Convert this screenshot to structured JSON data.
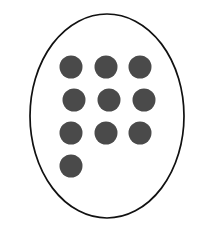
{
  "figure": {
    "canvas": {
      "width": 206,
      "height": 230,
      "background": "#ffffff"
    },
    "enclosure": {
      "shape_name": "oval-outline",
      "type": "ellipse",
      "cx": 107,
      "cy": 116,
      "rx": 77,
      "ry": 102,
      "fill": "#ffffff",
      "stroke_color": "#111111",
      "stroke_width": 1.7
    },
    "dots": {
      "count": 10,
      "fill_color": "#4a4a4a",
      "radius": 11.5,
      "rows": [
        {
          "row_index": 1,
          "count": 3,
          "cy": 67,
          "cx_values": [
            71,
            106,
            140
          ]
        },
        {
          "row_index": 2,
          "count": 3,
          "cy": 100,
          "cx_values": [
            74,
            109,
            144
          ]
        },
        {
          "row_index": 3,
          "count": 3,
          "cy": 133,
          "cx_values": [
            71,
            106,
            140
          ]
        },
        {
          "row_index": 4,
          "count": 1,
          "cy": 166,
          "cx_values": [
            71
          ]
        }
      ]
    }
  }
}
